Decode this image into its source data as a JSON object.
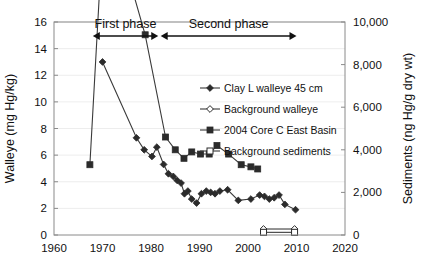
{
  "chart_data": {
    "type": "line",
    "title": "",
    "xlabel": "",
    "ylabel": "Walleye (mg Hg/kg)",
    "y2label": "Sediments (ng Hg/g dry wt)",
    "xlim": [
      1960,
      2020
    ],
    "ylim": [
      0,
      16
    ],
    "y2lim": [
      0,
      10000
    ],
    "xticks": [
      "1960",
      "1970",
      "1980",
      "1990",
      "2000",
      "2010",
      "2020"
    ],
    "xtick_values": [
      1960,
      1970,
      1980,
      1990,
      2000,
      2010,
      2020
    ],
    "yticks": [
      "0",
      "2",
      "4",
      "6",
      "8",
      "10",
      "12",
      "14",
      "16"
    ],
    "ytick_values": [
      0,
      2,
      4,
      6,
      8,
      10,
      12,
      14,
      16
    ],
    "y2ticks": [
      "0",
      "2,000",
      "4,000",
      "6,000",
      "8,000",
      "10,000"
    ],
    "y2tick_values": [
      0,
      2000,
      4000,
      6000,
      8000,
      10000
    ],
    "grid": true,
    "legend_position": "inside-right",
    "annotations": [
      {
        "text": "First phase",
        "x_start": 1968,
        "x_end": 1981.5
      },
      {
        "text": "Second phase",
        "x_start": 1982,
        "x_end": 2010
      }
    ],
    "series": [
      {
        "name": "Clay L walleye 45 cm",
        "marker": "filled-diamond",
        "axis": "left",
        "points": [
          [
            1970.0,
            13.0
          ],
          [
            1977.0,
            7.3
          ],
          [
            1978.6,
            6.4
          ],
          [
            1980.2,
            5.9
          ],
          [
            1981.2,
            6.6
          ],
          [
            1982.6,
            5.3
          ],
          [
            1983.6,
            4.6
          ],
          [
            1984.6,
            4.4
          ],
          [
            1985.4,
            4.1
          ],
          [
            1986.2,
            3.9
          ],
          [
            1986.9,
            3.1
          ],
          [
            1987.6,
            3.3
          ],
          [
            1988.4,
            2.7
          ],
          [
            1989.4,
            2.4
          ],
          [
            1990.4,
            3.1
          ],
          [
            1991.4,
            3.3
          ],
          [
            1992.3,
            3.2
          ],
          [
            1993.2,
            3.1
          ],
          [
            1994.2,
            3.3
          ],
          [
            1995.8,
            3.4
          ],
          [
            1998.0,
            2.6
          ],
          [
            2000.6,
            2.7
          ],
          [
            2002.4,
            3.0
          ],
          [
            2003.4,
            2.9
          ],
          [
            2004.4,
            2.7
          ],
          [
            2005.4,
            2.8
          ],
          [
            2006.4,
            3.0
          ],
          [
            2007.6,
            2.3
          ],
          [
            2009.8,
            1.9
          ]
        ]
      },
      {
        "name": "Background walleye",
        "marker": "open-diamond",
        "axis": "left",
        "points": [
          [
            2003.2,
            0.45
          ],
          [
            2009.6,
            0.45
          ]
        ]
      },
      {
        "name": "2004 Core C East Basin",
        "marker": "filled-square",
        "axis": "right",
        "points": [
          [
            1967.4,
            3.3
          ],
          [
            1969.4,
            11.5
          ],
          [
            1973.4,
            13.7
          ],
          [
            1978.8,
            9.4
          ],
          [
            1983.0,
            4.6
          ],
          [
            1985.0,
            4.0
          ],
          [
            1986.8,
            3.6
          ],
          [
            1988.4,
            3.9
          ],
          [
            1990.2,
            3.8
          ],
          [
            1992.0,
            3.8
          ],
          [
            1993.6,
            4.2
          ],
          [
            1996.0,
            3.8
          ],
          [
            1998.6,
            3.3
          ],
          [
            2000.6,
            3.2
          ],
          [
            2002.0,
            3.1
          ]
        ]
      },
      {
        "name": "Background sediments",
        "marker": "open-square",
        "axis": "left",
        "points": [
          [
            2003.2,
            0.2
          ],
          [
            2009.6,
            0.2
          ]
        ]
      }
    ]
  },
  "legend": {
    "items": [
      {
        "label": "Clay L walleye 45 cm",
        "marker": "filled-diamond"
      },
      {
        "label": "Background walleye",
        "marker": "open-diamond"
      },
      {
        "label": "2004 Core C East Basin",
        "marker": "filled-square"
      },
      {
        "label": "Background sediments",
        "marker": "open-square"
      }
    ]
  },
  "colors": {
    "line": "#3a3a3a",
    "marker": "#2b2b2b",
    "frame": "#8a8a8a",
    "grid": "#e8e8e8",
    "text": "#111111",
    "background": "#ffffff"
  }
}
